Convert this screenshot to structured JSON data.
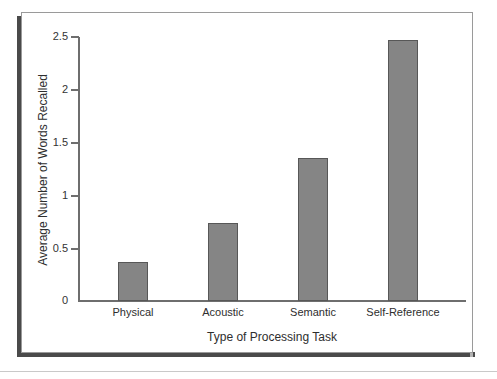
{
  "figure": {
    "background_color": "#ffffff",
    "frame_border_color": "#9a9a9a",
    "shadow_color": "#4a4a4a"
  },
  "chart_data": {
    "type": "bar",
    "title": "",
    "subtitle": "",
    "xlabel": "Type of Processing Task",
    "ylabel": "Average Number of Words Recalled",
    "categories": [
      "Physical",
      "Acoustic",
      "Semantic",
      "Self-Reference"
    ],
    "values": [
      0.37,
      0.74,
      1.35,
      2.47
    ],
    "ylim": [
      0,
      2.5
    ],
    "yticks": [
      0,
      0.5,
      1,
      1.5,
      2,
      2.5
    ],
    "ytick_labels": [
      "0",
      "0.5",
      "1",
      "1.5",
      "2",
      "2.5"
    ],
    "grid": false,
    "legend": null,
    "bar_fill_color": "#858585",
    "bar_edge_color": "#575757",
    "axis_color": "#6e6e6e"
  }
}
